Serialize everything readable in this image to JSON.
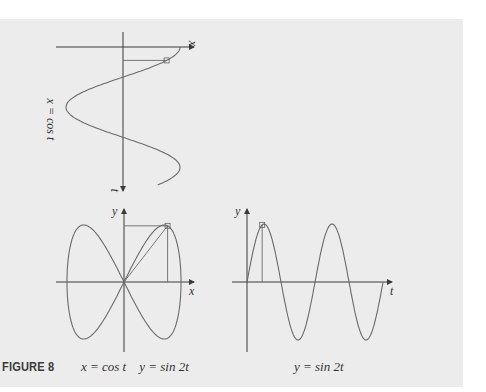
{
  "figure": {
    "label": "FIGURE 8",
    "caption_left": "x = cos t    y = sin 2t",
    "caption_right": "y = sin 2t",
    "top_graph_label": "x = cos t"
  },
  "axes": {
    "top_horizontal": "x",
    "top_vertical": "t",
    "bl_vertical": "y",
    "bl_horizontal": "x",
    "br_vertical": "y",
    "br_horizontal": "t"
  },
  "colors": {
    "background": "#ececec",
    "curve": "#6a6a6a",
    "axis": "#3a3a3a"
  },
  "chart_data": [
    {
      "type": "line",
      "title": "x = cos t",
      "xlabel": "x",
      "ylabel": "t",
      "orientation": "t axis points downward",
      "t_range": [
        0,
        7.2
      ],
      "x_range": [
        -1,
        1
      ],
      "marked_t": 0.7
    },
    {
      "type": "line",
      "title": "x = cos t, y = sin 2t",
      "xlabel": "x",
      "ylabel": "y",
      "curve": "parametric figure-eight (Lissajous)",
      "x_range": [
        -1,
        1
      ],
      "y_range": [
        -1,
        1
      ],
      "marked_t": 0.7
    },
    {
      "type": "line",
      "title": "y = sin 2t",
      "xlabel": "t",
      "ylabel": "y",
      "t_range": [
        0,
        6.28
      ],
      "y_range": [
        -1,
        1
      ],
      "marked_t": 0.7
    }
  ]
}
